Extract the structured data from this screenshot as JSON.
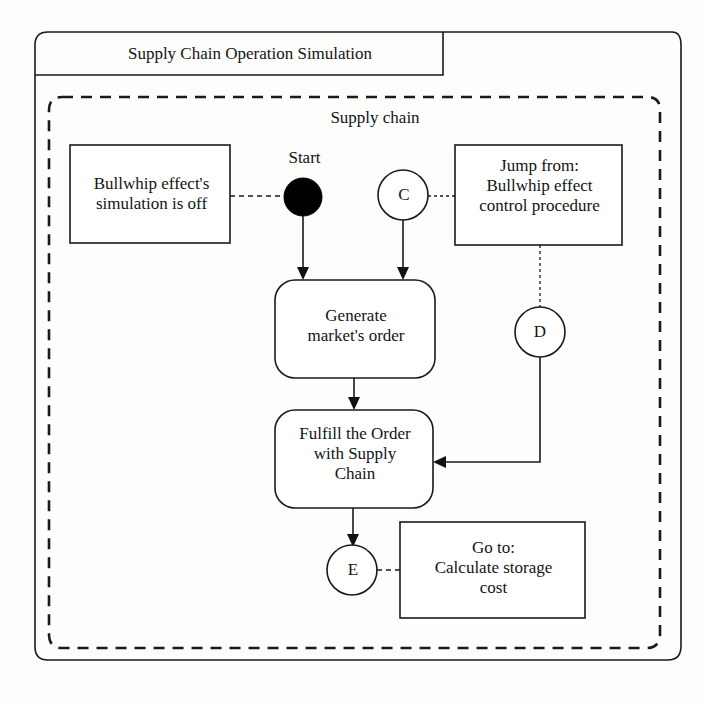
{
  "diagram": {
    "frame_title": "Supply Chain Operation Simulation",
    "partition_label": "Supply chain",
    "type": "flowchart",
    "colors": {
      "stroke": "#1a1a1a",
      "fill": "#ffffff",
      "start_node": "#000000",
      "background": "#fdfdfc"
    },
    "nodes": {
      "start": {
        "label": "Start",
        "shape": "filled-circle"
      },
      "note_bullwhip": {
        "label": "Bullwhip effect's\nsimulation is off",
        "shape": "rectangle"
      },
      "note_jump": {
        "label": "Jump from:\nBullwhip effect\ncontrol procedure",
        "shape": "rectangle"
      },
      "note_goto": {
        "label": "Go to:\nCalculate storage\ncost",
        "shape": "rectangle"
      },
      "action_generate": {
        "label": "Generate\nmarket's order",
        "shape": "rounded-rectangle"
      },
      "action_fulfill": {
        "label": "Fulfill the Order\nwith Supply\nChain",
        "shape": "rounded-rectangle"
      },
      "connector_c": {
        "label": "C",
        "shape": "circle"
      },
      "connector_d": {
        "label": "D",
        "shape": "circle"
      },
      "connector_e": {
        "label": "E",
        "shape": "circle"
      }
    },
    "edges": [
      {
        "from": "note_bullwhip",
        "to": "start",
        "style": "dashed",
        "arrow": false
      },
      {
        "from": "start",
        "to": "action_generate",
        "style": "solid",
        "arrow": true
      },
      {
        "from": "connector_c",
        "to": "action_generate",
        "style": "solid",
        "arrow": true
      },
      {
        "from": "note_jump",
        "to": "connector_c",
        "style": "dotted",
        "arrow": false
      },
      {
        "from": "note_jump",
        "to": "connector_d",
        "style": "dotted",
        "arrow": false
      },
      {
        "from": "connector_d",
        "to": "action_fulfill",
        "style": "solid",
        "arrow": true
      },
      {
        "from": "action_generate",
        "to": "action_fulfill",
        "style": "solid",
        "arrow": true
      },
      {
        "from": "action_fulfill",
        "to": "connector_e",
        "style": "solid",
        "arrow": true
      },
      {
        "from": "connector_e",
        "to": "note_goto",
        "style": "dashed",
        "arrow": false
      }
    ]
  }
}
